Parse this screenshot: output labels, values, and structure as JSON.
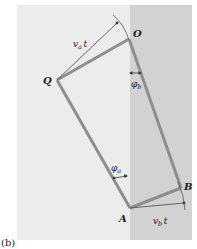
{
  "figure": {
    "caption": "(b)",
    "colors": {
      "background": "#ffffff",
      "medium_a": "#ececec",
      "medium_b": "#d2d2d2",
      "wavefront": "#8e8e8e",
      "ray": "#555555",
      "text": "#222222"
    },
    "regions": {
      "left": {
        "x": 17,
        "y": 5,
        "w": 113,
        "h": 235
      },
      "right": {
        "x": 130,
        "y": 5,
        "w": 62,
        "h": 235
      }
    },
    "points": {
      "Q": {
        "label": "Q",
        "x": 57,
        "y": 80
      },
      "O": {
        "label": "O",
        "x": 129,
        "y": 39
      },
      "A": {
        "label": "A",
        "x": 130,
        "y": 208
      },
      "B": {
        "label": "B",
        "x": 181,
        "y": 188
      }
    },
    "labels": {
      "Q": "Q",
      "O": "O",
      "A": "A",
      "B": "B",
      "va_t": "v",
      "va_t_sub": "a",
      "va_t_t": "t",
      "vb_t": "v",
      "vb_t_sub": "b",
      "vb_t_t": "t",
      "phi_a": "φ",
      "phi_a_sub": "a",
      "phi_b": "φ",
      "phi_b_sub": "b"
    }
  }
}
